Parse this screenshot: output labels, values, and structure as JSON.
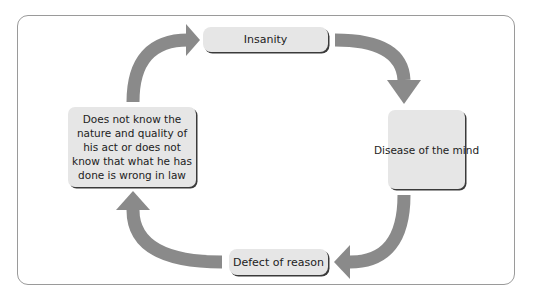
{
  "diagram": {
    "type": "cycle",
    "direction": "clockwise",
    "nodes": [
      {
        "id": "insanity",
        "label": "Insanity"
      },
      {
        "id": "disease",
        "label": "Disease of the mind"
      },
      {
        "id": "defect",
        "label": "Defect of reason"
      },
      {
        "id": "knowledge",
        "label": "Does not know the nature and quality of his act or does not know that what he has done is wrong in law"
      }
    ],
    "edges": [
      {
        "from": "insanity",
        "to": "disease"
      },
      {
        "from": "disease",
        "to": "defect"
      },
      {
        "from": "defect",
        "to": "knowledge"
      },
      {
        "from": "knowledge",
        "to": "insanity"
      }
    ]
  },
  "colors": {
    "arrow": "#8a8a8a",
    "box_fill": "#e6e6e6",
    "box_shadow": "#3a3a3a",
    "frame_border": "#9a9a9a",
    "text": "#222222"
  }
}
